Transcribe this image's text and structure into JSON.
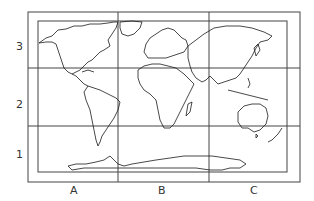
{
  "map": {
    "title": "World map with grid reference",
    "columns": [
      "A",
      "B",
      "C"
    ],
    "rows": [
      "3",
      "2",
      "1"
    ],
    "line_color": "#333333",
    "coast_color": "#1a1a1a"
  }
}
